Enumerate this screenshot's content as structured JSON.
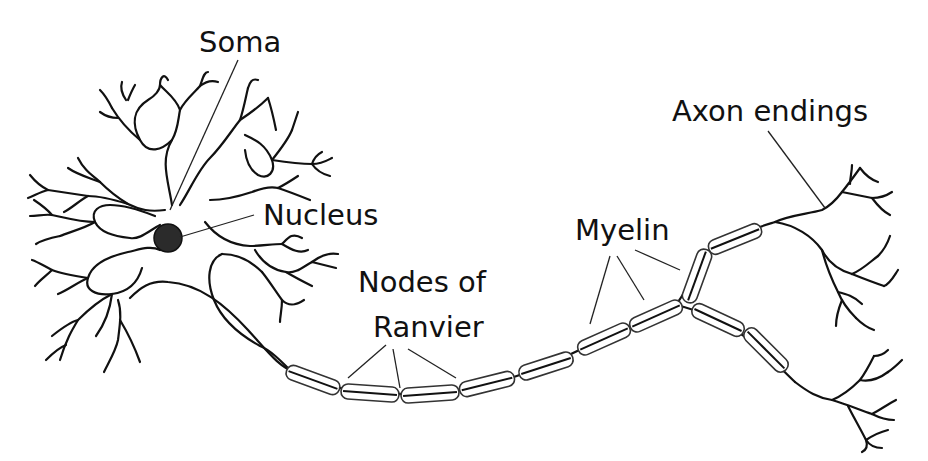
{
  "labels": {
    "soma": "Soma",
    "nucleus": "Nucleus",
    "nodes_line1": "Nodes of",
    "nodes_line2": "Ranvier",
    "myelin": "Myelin",
    "axon_endings": "Axon endings"
  },
  "colors": {
    "line": "#111111",
    "nucleus_fill": "#2b2b2b",
    "background": "#ffffff"
  },
  "structures": [
    "dendrites",
    "soma",
    "nucleus",
    "axon",
    "myelin-sheath",
    "nodes-of-ranvier",
    "axon-terminals"
  ],
  "myelin_segments": [
    {
      "cx": 313,
      "cy": 380,
      "w": 56,
      "rot": 20
    },
    {
      "cx": 370,
      "cy": 393,
      "w": 58,
      "rot": 4
    },
    {
      "cx": 430,
      "cy": 394,
      "w": 58,
      "rot": -4
    },
    {
      "cx": 487,
      "cy": 384,
      "w": 56,
      "rot": -14
    },
    {
      "cx": 546,
      "cy": 366,
      "w": 56,
      "rot": -18
    },
    {
      "cx": 604,
      "cy": 339,
      "w": 56,
      "rot": -24
    },
    {
      "cx": 656,
      "cy": 316,
      "w": 56,
      "rot": -24
    },
    {
      "cx": 697,
      "cy": 276,
      "w": 56,
      "rot": -70
    },
    {
      "cx": 735,
      "cy": 239,
      "w": 56,
      "rot": -22
    },
    {
      "cx": 718,
      "cy": 320,
      "w": 56,
      "rot": 25
    },
    {
      "cx": 766,
      "cy": 350,
      "w": 56,
      "rot": 45
    }
  ]
}
